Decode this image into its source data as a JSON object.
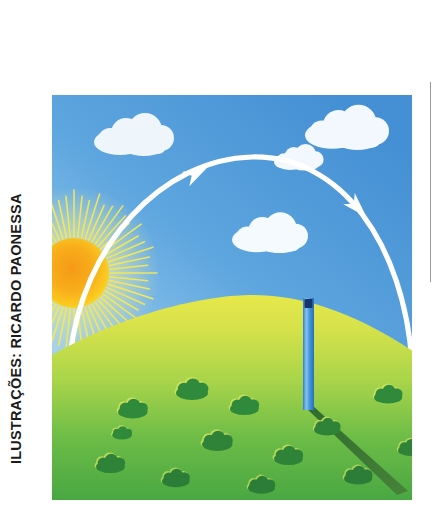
{
  "page": {
    "width": 436,
    "height": 508,
    "background_color": "#ffffff"
  },
  "credit": {
    "text": "ILUSTRAÇÕES: RICARDO PAONESSA",
    "orientation": "vertical-rotated-90-ccw",
    "color": "#1b1b1b"
  },
  "illustration": {
    "title": "Movimento aparente do Sol e sombra do gnômon",
    "bounds": {
      "x": 52,
      "y": 95,
      "width": 360,
      "height": 405
    },
    "sky": {
      "name": "sky",
      "top_color": "#4a95d6",
      "mid_color": "#6fb0e4",
      "horizon_color": "#cfe6f6"
    },
    "hill": {
      "name": "grass-hill",
      "crest_color": "#e2e64b",
      "upper_color": "#c4dc4b",
      "lower_color": "#55b14a",
      "bottom_color": "#45a541"
    },
    "sun": {
      "name": "sun",
      "core_color": "#f6a01e",
      "inner_color": "#fbc41f",
      "ray_color": "#f4e85c",
      "cx": 22,
      "cy": 178,
      "core_radius": 34,
      "ray_count": 60,
      "ray_outer_radius": 74
    },
    "sun_path_arc": {
      "name": "sun-path-arc",
      "color": "#ffffff",
      "stroke_width": 5,
      "direction": "left-to-right (east to west)",
      "arrow_count": 2
    },
    "arrows": [
      {
        "name": "arc-arrow-ascending",
        "x": 145,
        "y": 78,
        "angle_deg": -33
      },
      {
        "name": "arc-arrow-descending",
        "x": 305,
        "y": 112,
        "angle_deg": 44
      }
    ],
    "clouds": [
      {
        "name": "cloud-upper-left",
        "x": 42,
        "y": 23,
        "scale": 1.0
      },
      {
        "name": "cloud-upper-right",
        "x": 253,
        "y": 15,
        "scale": 1.05
      },
      {
        "name": "cloud-small-right",
        "x": 222,
        "y": 52,
        "scale": 0.62
      },
      {
        "name": "cloud-mid-right",
        "x": 180,
        "y": 122,
        "scale": 0.95
      }
    ],
    "gnomon": {
      "name": "gnomon-pole",
      "body_color": "#3d90d8",
      "light_color": "#79bce9",
      "cap_color": "#17356e",
      "x": 251,
      "top_y": 203,
      "width": 11,
      "height": 112
    },
    "shadow": {
      "name": "gnomon-shadow",
      "color": "#3d7a33",
      "from_x": 256,
      "from_y": 315,
      "to_x": 352,
      "to_y": 398,
      "width": 9
    },
    "bushes": [
      {
        "name": "bush",
        "x": 124,
        "y": 285,
        "scale": 1.0
      },
      {
        "name": "bush",
        "x": 66,
        "y": 305,
        "scale": 0.92
      },
      {
        "name": "bush",
        "x": 178,
        "y": 302,
        "scale": 0.9
      },
      {
        "name": "bush",
        "x": 322,
        "y": 291,
        "scale": 0.88
      },
      {
        "name": "bush",
        "x": 150,
        "y": 337,
        "scale": 0.95
      },
      {
        "name": "bush",
        "x": 222,
        "y": 352,
        "scale": 0.9
      },
      {
        "name": "bush",
        "x": 44,
        "y": 360,
        "scale": 0.9
      },
      {
        "name": "bush",
        "x": 262,
        "y": 324,
        "scale": 0.82
      },
      {
        "name": "bush",
        "x": 110,
        "y": 375,
        "scale": 0.86
      },
      {
        "name": "bush",
        "x": 196,
        "y": 382,
        "scale": 0.84
      },
      {
        "name": "bush",
        "x": 292,
        "y": 372,
        "scale": 0.88
      },
      {
        "name": "bush",
        "x": 346,
        "y": 345,
        "scale": 0.8
      },
      {
        "name": "bush",
        "x": 60,
        "y": 332,
        "scale": 0.62
      }
    ]
  }
}
